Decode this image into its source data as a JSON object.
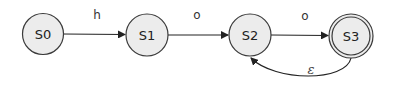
{
  "diagram": {
    "type": "finite-automaton",
    "states": [
      {
        "id": "S0",
        "label": "S0",
        "accepting": false
      },
      {
        "id": "S1",
        "label": "S1",
        "accepting": false
      },
      {
        "id": "S2",
        "label": "S2",
        "accepting": false
      },
      {
        "id": "S3",
        "label": "S3",
        "accepting": true
      }
    ],
    "transitions": [
      {
        "from": "S0",
        "to": "S1",
        "label": "h"
      },
      {
        "from": "S1",
        "to": "S2",
        "label": "o"
      },
      {
        "from": "S2",
        "to": "S3",
        "label": "o"
      },
      {
        "from": "S3",
        "to": "S2",
        "label": "ε"
      }
    ]
  },
  "colors": {
    "state_fill": "#ececec",
    "stroke": "#3a3a3a"
  }
}
